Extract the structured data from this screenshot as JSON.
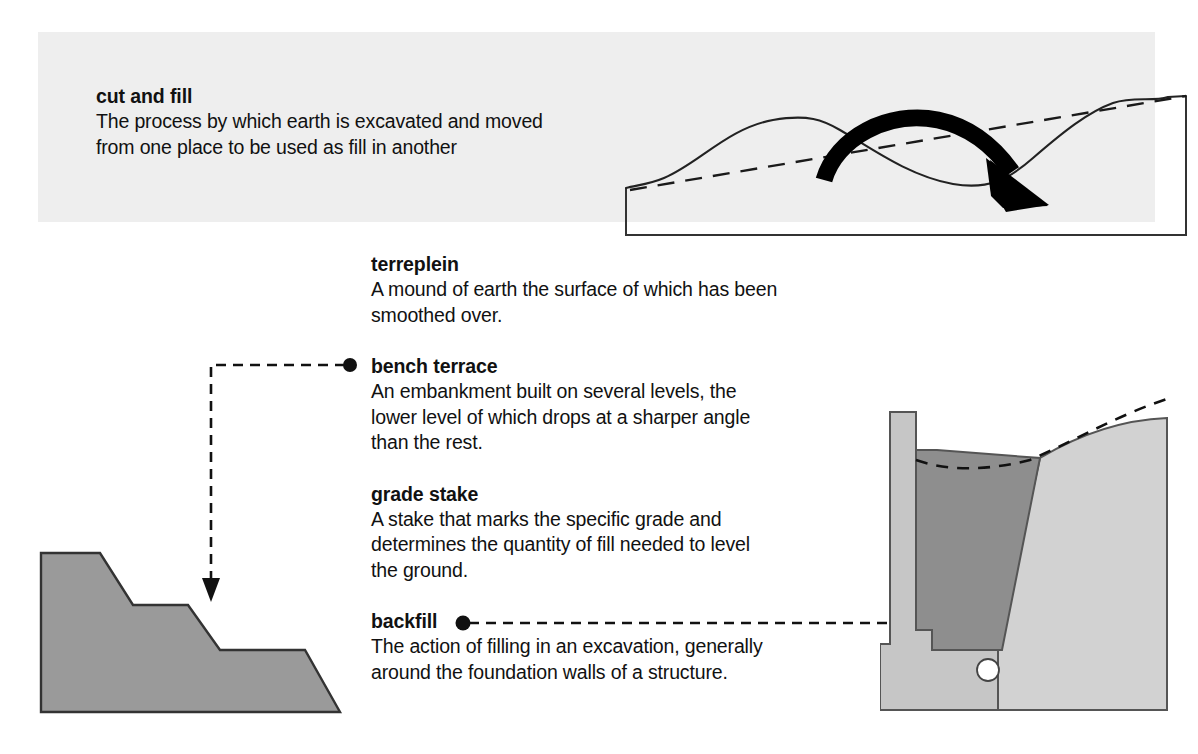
{
  "page": {
    "background_color": "#ffffff",
    "band_color": "#eeeeee",
    "ink_color": "#111111"
  },
  "header": {
    "term": "cut and fill",
    "definition": "The process by which earth is excavated and moved\nfrom one place to be used as fill in another",
    "figure_name": "cut-and-fill-terrain-profile",
    "figure_caption_elements": [
      "terrain-profile-curve",
      "original-grade-dashed-line",
      "earth-movement-arrow",
      "ground-base-outline"
    ]
  },
  "glossary": {
    "entries": [
      {
        "id": "terreplein",
        "term": "terreplein",
        "definition": "A mound of earth the surface of which has been\nsmoothed over.",
        "has_leader": false
      },
      {
        "id": "bench-terrace",
        "term": "bench terrace",
        "definition": "An embankment built on several levels, the\nlower level of which drops at a sharper angle\nthan the rest.",
        "has_leader": true,
        "leader_direction": "left-then-down"
      },
      {
        "id": "grade-stake",
        "term": "grade stake",
        "definition": "A stake that marks the specific grade and\ndetermines the quantity of fill needed to level\nthe ground.",
        "has_leader": false
      },
      {
        "id": "backfill",
        "term": "backfill",
        "definition": "The action of filling in an excavation, generally\naround the foundation walls of a structure.",
        "has_leader": true,
        "leader_direction": "right"
      }
    ]
  },
  "figures": {
    "terrace": {
      "name": "bench-terrace-diagram",
      "fill_color": "#9a9a9a",
      "stroke_color": "#333333",
      "levels": 3
    },
    "backfill": {
      "name": "backfill-foundation-diagram",
      "foundation_color": "#c6c6c6",
      "backfill_color": "#8e8e8e",
      "undisturbed_earth_color": "#d2d2d2",
      "drain_pipe_color": "#ffffff",
      "stroke_color": "#555555",
      "elements": [
        "foundation-wall",
        "foundation-footing",
        "backfill-wedge",
        "undisturbed-earth",
        "original-grade-dashed-line",
        "drain-pipe"
      ]
    }
  },
  "colors": {
    "arrow": "#000000",
    "dashed_line": "#1a1a1a"
  }
}
